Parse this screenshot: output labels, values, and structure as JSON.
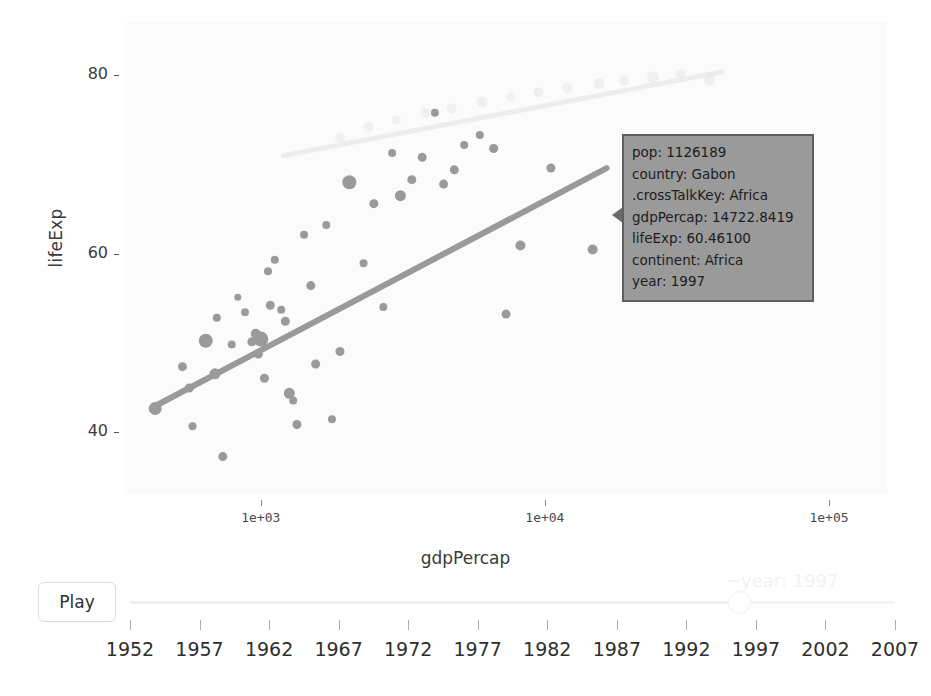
{
  "chart_data": {
    "type": "scatter",
    "title": "",
    "xlabel": "gdpPercap",
    "ylabel": "lifeExp",
    "xscale": "log",
    "xlim": [
      330,
      160000
    ],
    "ylim": [
      33,
      86
    ],
    "xticks": [
      "1e+03",
      "1e+04",
      "1e+05"
    ],
    "xtick_values": [
      1000,
      10000,
      100000
    ],
    "yticks": [
      "80",
      "60",
      "40"
    ],
    "ytick_values": [
      80,
      60,
      40
    ],
    "grid": false,
    "legend": "none",
    "series": [
      {
        "name": "africa-1997",
        "color": "#9a9a9a",
        "opacity": 1,
        "points": [
          {
            "x": 425,
            "y": 42.6,
            "r": 6.5
          },
          {
            "x": 530,
            "y": 47.3,
            "r": 4.5
          },
          {
            "x": 560,
            "y": 44.9,
            "r": 4.5
          },
          {
            "x": 575,
            "y": 40.6,
            "r": 4.0
          },
          {
            "x": 640,
            "y": 50.2,
            "r": 7.0
          },
          {
            "x": 690,
            "y": 46.5,
            "r": 5.5
          },
          {
            "x": 700,
            "y": 52.8,
            "r": 4.0
          },
          {
            "x": 735,
            "y": 37.2,
            "r": 4.5
          },
          {
            "x": 790,
            "y": 49.8,
            "r": 4.0
          },
          {
            "x": 830,
            "y": 55.1,
            "r": 3.5
          },
          {
            "x": 880,
            "y": 53.4,
            "r": 4.0
          },
          {
            "x": 930,
            "y": 50.1,
            "r": 4.5
          },
          {
            "x": 960,
            "y": 51.0,
            "r": 5.0
          },
          {
            "x": 980,
            "y": 48.7,
            "r": 4.5
          },
          {
            "x": 1000,
            "y": 50.4,
            "r": 7.5
          },
          {
            "x": 1030,
            "y": 46.0,
            "r": 4.5
          },
          {
            "x": 1060,
            "y": 58.0,
            "r": 4.0
          },
          {
            "x": 1080,
            "y": 54.2,
            "r": 4.5
          },
          {
            "x": 1120,
            "y": 59.3,
            "r": 4.0
          },
          {
            "x": 1180,
            "y": 53.7,
            "r": 4.0
          },
          {
            "x": 1220,
            "y": 52.4,
            "r": 4.5
          },
          {
            "x": 1260,
            "y": 44.3,
            "r": 5.5
          },
          {
            "x": 1300,
            "y": 43.5,
            "r": 4.0
          },
          {
            "x": 1340,
            "y": 40.8,
            "r": 4.5
          },
          {
            "x": 1420,
            "y": 62.1,
            "r": 4.0
          },
          {
            "x": 1500,
            "y": 56.4,
            "r": 4.5
          },
          {
            "x": 1560,
            "y": 47.6,
            "r": 4.5
          },
          {
            "x": 1700,
            "y": 63.2,
            "r": 4.0
          },
          {
            "x": 1780,
            "y": 41.4,
            "r": 4.0
          },
          {
            "x": 1900,
            "y": 49.0,
            "r": 4.5
          },
          {
            "x": 2050,
            "y": 68.0,
            "r": 7.0
          },
          {
            "x": 2300,
            "y": 58.9,
            "r": 4.0
          },
          {
            "x": 2500,
            "y": 65.6,
            "r": 4.5
          },
          {
            "x": 2700,
            "y": 54.0,
            "r": 4.0
          },
          {
            "x": 2900,
            "y": 71.3,
            "r": 4.0
          },
          {
            "x": 3100,
            "y": 66.5,
            "r": 5.5
          },
          {
            "x": 3400,
            "y": 68.3,
            "r": 4.5
          },
          {
            "x": 3700,
            "y": 70.8,
            "r": 4.5
          },
          {
            "x": 4100,
            "y": 75.8,
            "r": 4.0
          },
          {
            "x": 4400,
            "y": 67.8,
            "r": 4.5
          },
          {
            "x": 4800,
            "y": 69.4,
            "r": 4.5
          },
          {
            "x": 5200,
            "y": 72.2,
            "r": 4.0
          },
          {
            "x": 5900,
            "y": 73.3,
            "r": 4.0
          },
          {
            "x": 6600,
            "y": 71.8,
            "r": 4.5
          },
          {
            "x": 7300,
            "y": 53.2,
            "r": 4.5
          },
          {
            "x": 8200,
            "y": 60.9,
            "r": 5.0
          },
          {
            "x": 10500,
            "y": 69.6,
            "r": 4.5
          },
          {
            "x": 14722.8419,
            "y": 60.461,
            "r": 5.0,
            "highlighted": true
          }
        ]
      },
      {
        "name": "other-faded",
        "color": "#e2e2e2",
        "opacity": 0.4,
        "points": [
          {
            "x": 1900,
            "y": 73.0,
            "r": 5.0
          },
          {
            "x": 2400,
            "y": 74.2,
            "r": 5.0
          },
          {
            "x": 3000,
            "y": 75.0,
            "r": 4.5
          },
          {
            "x": 3800,
            "y": 75.8,
            "r": 5.0
          },
          {
            "x": 4700,
            "y": 76.3,
            "r": 5.0
          },
          {
            "x": 6000,
            "y": 77.0,
            "r": 5.5
          },
          {
            "x": 7600,
            "y": 77.6,
            "r": 4.5
          },
          {
            "x": 9500,
            "y": 78.1,
            "r": 5.0
          },
          {
            "x": 12000,
            "y": 78.6,
            "r": 5.0
          },
          {
            "x": 15500,
            "y": 79.1,
            "r": 5.5
          },
          {
            "x": 19000,
            "y": 79.4,
            "r": 5.0
          },
          {
            "x": 24000,
            "y": 79.8,
            "r": 6.0
          },
          {
            "x": 30000,
            "y": 80.2,
            "r": 5.0
          },
          {
            "x": 38000,
            "y": 79.5,
            "r": 5.5
          }
        ]
      }
    ],
    "trendlines": [
      {
        "name": "africa-trend",
        "color": "#9a9a9a",
        "width": 6,
        "x0": 420,
        "y0": 42.8,
        "x1": 16500,
        "y1": 69.6
      },
      {
        "name": "faded-trend",
        "color": "#ededed",
        "width": 5,
        "x0": 1200,
        "y0": 71.0,
        "x1": 42000,
        "y1": 80.4
      }
    ]
  },
  "tooltip": {
    "visible": true,
    "rows": [
      {
        "key": "pop:",
        "value": "1126189"
      },
      {
        "key": "country:",
        "value": "Gabon"
      },
      {
        "key": ".crossTalkKey:",
        "value": "Africa"
      },
      {
        "key": "gdpPercap:",
        "value": "14722.8419"
      },
      {
        "key": "lifeExp:",
        "value": "60.46100"
      },
      {
        "key": "continent:",
        "value": "Africa"
      },
      {
        "key": "year:",
        "value": "1997"
      }
    ],
    "background_color": "#9a9a9a",
    "border_color": "#5e5e5e"
  },
  "controls": {
    "play_label": "Play",
    "slider": {
      "value_label": "~year: 1997",
      "current_value": "1997",
      "min": "1952",
      "max": "2007",
      "step": "5",
      "years": [
        "1952",
        "1957",
        "1962",
        "1967",
        "1972",
        "1977",
        "1982",
        "1987",
        "1992",
        "1997",
        "2002",
        "2007"
      ]
    }
  }
}
